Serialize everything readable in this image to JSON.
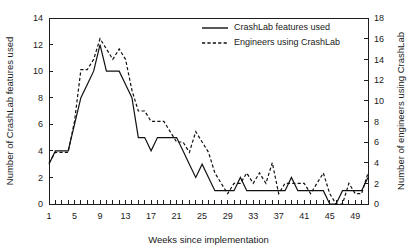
{
  "chart_data": {
    "type": "line",
    "title": "",
    "xlabel": "Weeks since implementation",
    "ylabel": "Number of CrashLab features used",
    "y2label": "Number of engineers using CrashLab",
    "grid": false,
    "legend_position": "top-center",
    "xlim": [
      1,
      51
    ],
    "ylim": [
      0,
      14
    ],
    "y2lim": [
      0,
      18
    ],
    "xticks": [
      1,
      5,
      9,
      13,
      17,
      21,
      25,
      29,
      33,
      37,
      41,
      45,
      49
    ],
    "yticks": [
      0,
      2,
      4,
      6,
      8,
      10,
      12,
      14
    ],
    "y2ticks": [
      0,
      2,
      4,
      6,
      8,
      10,
      12,
      14,
      16,
      18
    ],
    "x": [
      1,
      2,
      3,
      4,
      5,
      6,
      7,
      8,
      9,
      10,
      11,
      12,
      13,
      14,
      15,
      16,
      17,
      18,
      19,
      20,
      21,
      22,
      23,
      24,
      25,
      26,
      27,
      28,
      29,
      30,
      31,
      32,
      33,
      34,
      35,
      36,
      37,
      38,
      39,
      40,
      41,
      42,
      43,
      44,
      45,
      46,
      47,
      48,
      49,
      50,
      51
    ],
    "series": [
      {
        "name": "CrashLab features used",
        "style": "solid",
        "axis": "left",
        "values": [
          3,
          4,
          4,
          4,
          6,
          8,
          9,
          10,
          12,
          10,
          10,
          10,
          9,
          8,
          5,
          5,
          4,
          5,
          5,
          5,
          5,
          4,
          3,
          2,
          3,
          2,
          1,
          1,
          1,
          1,
          2,
          1,
          1,
          1,
          1,
          1,
          1,
          1,
          2,
          1,
          1,
          1,
          1,
          1,
          0,
          0,
          1,
          1,
          1,
          1,
          2
        ]
      },
      {
        "name": "Engineers using CrashLab",
        "style": "dashed",
        "axis": "right",
        "values": [
          4,
          5,
          5,
          5,
          8,
          13,
          13,
          14,
          16,
          15,
          14,
          15,
          14,
          11,
          9,
          9,
          8,
          8,
          8,
          7,
          6,
          6,
          5,
          7,
          6,
          5,
          3,
          2,
          1,
          2,
          2,
          3,
          2,
          3,
          2,
          4,
          1,
          2,
          2,
          2,
          2,
          1,
          2,
          3,
          1,
          0,
          0,
          2,
          1,
          1,
          3
        ]
      }
    ]
  },
  "legend": {
    "entries": [
      {
        "label": "CrashLab features used",
        "style": "solid"
      },
      {
        "label": "Engineers using CrashLab",
        "style": "dashed"
      }
    ]
  },
  "axes": {
    "left_title": "Number of CrashLab features used",
    "right_title": "Number of engineers using CrashLab",
    "x_title": "Weeks since implementation"
  },
  "header": {
    "cropped_text": ""
  }
}
